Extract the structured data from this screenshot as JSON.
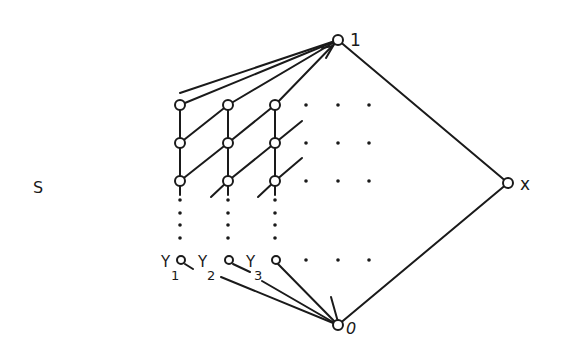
{
  "diagram": {
    "labels": {
      "top": "1",
      "bottom": "0",
      "right": "x",
      "set": "S",
      "y1": "Y",
      "y1_sub": "1",
      "y2": "Y",
      "y2_sub": "2",
      "y3": "Y",
      "y3_sub": "3"
    },
    "colors": {
      "ink": "#1a1a1a",
      "background": "#ffffff"
    },
    "nodes": [
      {
        "id": "top",
        "label": "1"
      },
      {
        "id": "bottom",
        "label": "0"
      },
      {
        "id": "x",
        "label": "x"
      },
      {
        "id": "y1",
        "label": "Y1"
      },
      {
        "id": "y2",
        "label": "Y2"
      },
      {
        "id": "y3",
        "label": "Y3"
      }
    ],
    "grid": {
      "columns": 3,
      "rows": 3,
      "ellipsis": "continues right and downward"
    }
  }
}
